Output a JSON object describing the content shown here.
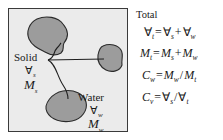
{
  "figure": {
    "phase_box": {
      "name": "soil-phase-box",
      "background_color": "#ebebeb",
      "border_color": "#3a3a3a"
    },
    "blobs": [
      {
        "id": "solid-blob-top",
        "phase": "Solid",
        "fill": "#9c9c9c",
        "stroke": "#2b2b2b"
      },
      {
        "id": "solid-blob-bottom",
        "phase": "Solid",
        "fill": "#9c9c9c",
        "stroke": "#2b2b2b"
      },
      {
        "id": "water-blob",
        "phase": "Water",
        "fill": "#9c9c9c",
        "stroke": "#2b2b2b"
      }
    ],
    "labels": {
      "solid": {
        "name": "Solid",
        "volume_symbol": "∀",
        "volume_subscript": "s",
        "mass_symbol": "M",
        "mass_subscript": "s"
      },
      "water": {
        "name": "Water",
        "volume_symbol": "∀",
        "volume_subscript": "w",
        "mass_symbol": "M",
        "mass_subscript": "w"
      }
    }
  },
  "equations": {
    "title": "Total",
    "items": [
      {
        "id": "volume-balance",
        "lhs_symbol": "∀",
        "lhs_sub": "t",
        "parts": [
          {
            "symbol": "∀",
            "sub": "s"
          },
          {
            "op": "+"
          },
          {
            "symbol": "∀",
            "sub": "w"
          }
        ],
        "plain": "∀t = ∀s + ∀w"
      },
      {
        "id": "mass-balance",
        "lhs_symbol": "M",
        "lhs_sub": "t",
        "parts": [
          {
            "symbol": "M",
            "sub": "s"
          },
          {
            "op": "+"
          },
          {
            "symbol": "M",
            "sub": "w"
          }
        ],
        "plain": "Mt = Ms + Mw"
      },
      {
        "id": "gravimetric-water-content",
        "lhs_symbol": "C",
        "lhs_sub": "w",
        "parts": [
          {
            "symbol": "M",
            "sub": "w"
          },
          {
            "op": "/"
          },
          {
            "symbol": "M",
            "sub": "t"
          }
        ],
        "plain": "Cw = Mw/Mt"
      },
      {
        "id": "volumetric-solid-content",
        "lhs_symbol": "C",
        "lhs_sub": "v",
        "parts": [
          {
            "symbol": "∀",
            "sub": "s"
          },
          {
            "op": "/"
          },
          {
            "symbol": "∀",
            "sub": "t"
          }
        ],
        "plain": "Cv = ∀s/∀t"
      }
    ]
  },
  "colors": {
    "blob_fill": "#9c9c9c",
    "blob_stroke": "#2b2b2b",
    "box_fill": "#ebebeb",
    "box_border": "#3a3a3a",
    "leader_line": "#1f1f1f",
    "text": "#1a1a1a"
  }
}
